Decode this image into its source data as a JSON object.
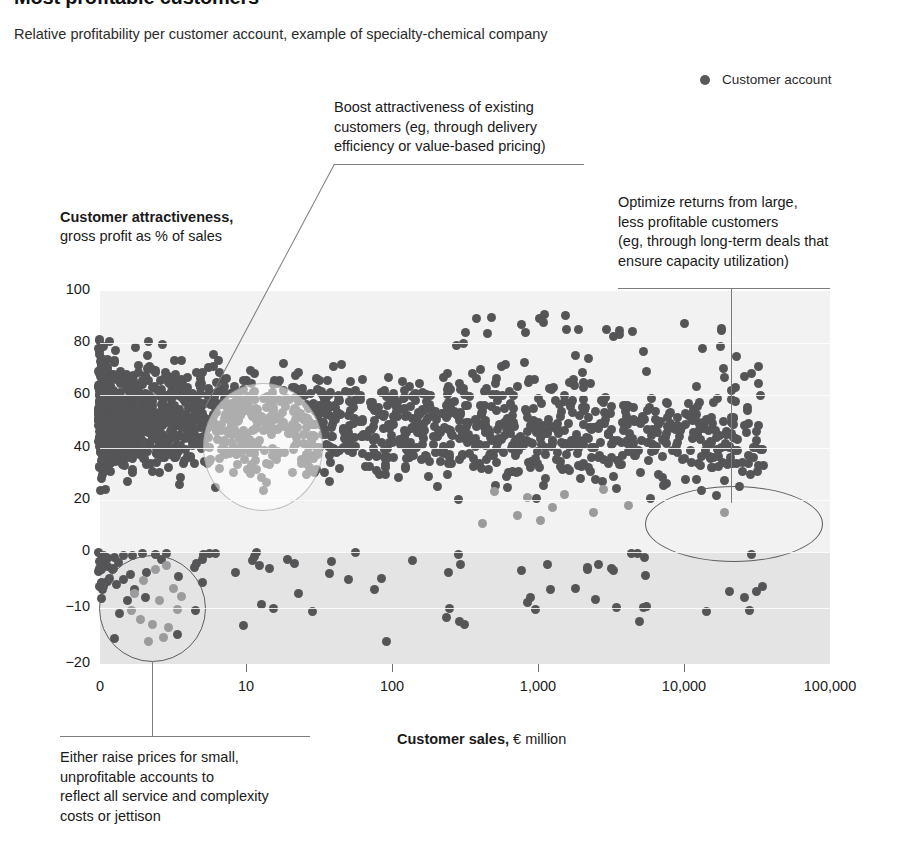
{
  "header": {
    "title": "Most profitable customers",
    "subtitle": "Relative profitability per customer account, example of specialty-chemical company"
  },
  "legend": {
    "marker_icon": "filled-circle-icon",
    "label": "Customer account",
    "color": "#595959"
  },
  "axes": {
    "y_title_strong": "Customer attractiveness,",
    "y_title_sub": "gross profit as % of sales",
    "x_title_strong": "Customer sales,",
    "x_title_sub": " € million",
    "y_ticks": [
      "100",
      "80",
      "60",
      "40",
      "20",
      "0",
      "−10",
      "−20"
    ],
    "x_ticks": [
      "0",
      "10",
      "100",
      "1,000",
      "10,000",
      "100,000"
    ]
  },
  "annotations": [
    {
      "id": "boost",
      "lines": [
        "Boost attractiveness of existing",
        "customers (eg, through delivery",
        "efficiency or value-based pricing)"
      ]
    },
    {
      "id": "optimize",
      "lines": [
        "Optimize returns from large,",
        "less profitable customers",
        "(eg, through long-term deals that",
        "ensure capacity utilization)"
      ]
    },
    {
      "id": "raise-prices",
      "lines": [
        "Either raise prices for small,",
        "unprofitable accounts to",
        "reflect all service and complexity",
        "costs or jettison"
      ]
    }
  ],
  "chart_data": {
    "type": "scatter",
    "title": "Most profitable customers",
    "subtitle": "Relative profitability per customer account, example of specialty-chemical company",
    "xlabel": "Customer sales, € million",
    "ylabel": "Customer attractiveness, gross profit as % of sales",
    "x_scale": "log",
    "x_ticks": [
      0,
      10,
      100,
      1000,
      10000,
      100000
    ],
    "x_tick_labels": [
      "0",
      "10",
      "100",
      "1,000",
      "10,000",
      "100,000"
    ],
    "y_ticks": [
      100,
      80,
      60,
      40,
      20,
      0,
      -10,
      -20
    ],
    "y_tick_labels": [
      "100",
      "80",
      "60",
      "40",
      "20",
      "0",
      "−10",
      "−20"
    ],
    "ylim": [
      -20,
      100
    ],
    "grid": true,
    "legend": [
      "Customer account"
    ],
    "series": [
      {
        "name": "Customer account",
        "color": "#555557",
        "n_points": 1600,
        "description": "Dense cloud of customer accounts; attractiveness concentrated 20-85% for small customers, tapering to 10-80% for large customers; a thin tail of unprofitable accounts below 0%."
      }
    ],
    "highlight_groups": [
      {
        "name": "small-unprofitable-accounts",
        "shape": "circle",
        "x_range": [
          1,
          6
        ],
        "y_range": [
          -18,
          -1
        ],
        "n_points": 14,
        "annotation": "Either raise prices for small, unprofitable accounts to reflect all service and complexity costs or jettison"
      },
      {
        "name": "mid-size-existing-customers",
        "shape": "circle",
        "x_range": [
          4,
          40
        ],
        "y_range": [
          18,
          70
        ],
        "annotation": "Boost attractiveness of existing customers (eg, through delivery efficiency or value-based pricing)"
      },
      {
        "name": "large-less-profitable-customers",
        "shape": "ellipse",
        "x_range": [
          4000,
          60000
        ],
        "y_range": [
          8,
          26
        ],
        "n_points": 11,
        "annotation": "Optimize returns from large, less profitable customers (eg, through long-term deals that ensure capacity utilization)"
      }
    ]
  }
}
